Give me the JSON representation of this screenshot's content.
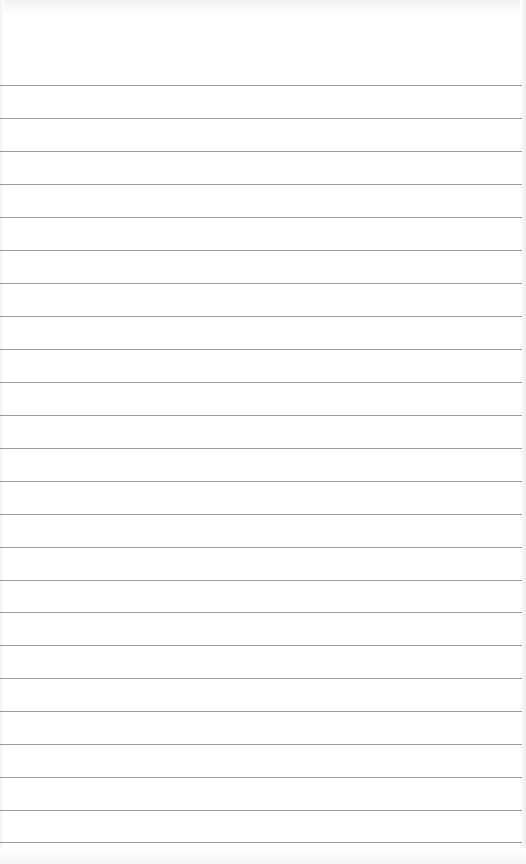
{
  "notepad": {
    "type": "lined-paper",
    "line_color": "#8a8a8a",
    "background_color": "#ffffff",
    "line_count": 24,
    "line_spacing_px": 33,
    "lines_y": [
      85,
      118,
      151,
      184,
      217,
      250,
      283,
      316,
      349,
      382,
      415,
      448,
      481,
      514,
      547,
      580,
      612,
      645,
      678,
      711,
      744,
      777,
      810,
      842
    ],
    "text_lines": []
  }
}
